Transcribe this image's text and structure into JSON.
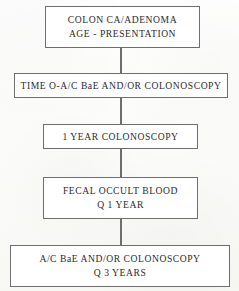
{
  "document": {
    "kind": "flowchart",
    "title": "Colon CA/Adenoma surveillance flowchart",
    "orientation": "top-to-bottom",
    "colors": {
      "page_background": "#fdfdfb",
      "box_fill": "#ffffff",
      "box_border": "#6e6e6e",
      "text": "#2b2b2b",
      "connector": "#6e6e6e"
    }
  },
  "nodes": [
    {
      "id": "node-1",
      "name": "colon-ca-adenoma-age-presentation",
      "lines": [
        "COLON CA/ADENOMA",
        "AGE - PRESENTATION"
      ]
    },
    {
      "id": "node-2",
      "name": "time-0-ac-bae-andor-colonoscopy",
      "lines": [
        "TIME O-A/C BaE AND/OR COLONOSCOPY"
      ]
    },
    {
      "id": "node-3",
      "name": "one-year-colonoscopy",
      "lines": [
        "1 YEAR COLONOSCOPY"
      ]
    },
    {
      "id": "node-4",
      "name": "fecal-occult-blood-q-1-year",
      "lines": [
        "FECAL OCCULT BLOOD",
        "Q 1 YEAR"
      ]
    },
    {
      "id": "node-5",
      "name": "ac-bae-andor-colonoscopy-q-3-years",
      "lines": [
        "A/C BaE AND/OR COLONOSCOPY",
        "Q 3 YEARS"
      ]
    }
  ],
  "connectors": [
    {
      "id": "connector-1",
      "from": "node-1",
      "to": "node-2"
    },
    {
      "id": "connector-2",
      "from": "node-2",
      "to": "node-3"
    },
    {
      "id": "connector-3",
      "from": "node-3",
      "to": "node-4"
    },
    {
      "id": "connector-4",
      "from": "node-4",
      "to": "node-5"
    }
  ]
}
